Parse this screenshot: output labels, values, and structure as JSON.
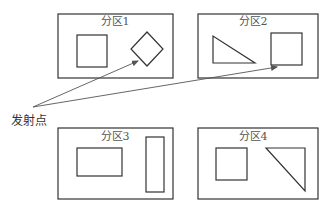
{
  "diagram": {
    "launch_point": {
      "label": "发射点",
      "x": 33,
      "y": 107
    },
    "colors": {
      "stroke": "#333333",
      "arrow": "#555555",
      "text": "#555555",
      "background": "#ffffff"
    },
    "partitions": [
      {
        "id": "p1",
        "label": "分区1",
        "box": {
          "x": 58,
          "y": 14,
          "w": 115,
          "h": 64
        },
        "shapes": [
          {
            "type": "square",
            "x": 77,
            "y": 35,
            "w": 30,
            "h": 32
          },
          {
            "type": "diamond",
            "points": "147,32 163,49 147,66 131,49"
          }
        ]
      },
      {
        "id": "p2",
        "label": "分区2",
        "box": {
          "x": 198,
          "y": 14,
          "w": 120,
          "h": 64
        },
        "shapes": [
          {
            "type": "triangle",
            "points": "213,36 213,63 255,63"
          },
          {
            "type": "square",
            "x": 271,
            "y": 33,
            "w": 31,
            "h": 32
          }
        ]
      },
      {
        "id": "p3",
        "label": "分区3",
        "box": {
          "x": 58,
          "y": 128,
          "w": 115,
          "h": 71
        },
        "shapes": [
          {
            "type": "rectangle",
            "x": 77,
            "y": 148,
            "w": 45,
            "h": 28
          },
          {
            "type": "rectangle",
            "x": 146,
            "y": 137,
            "w": 18,
            "h": 55
          }
        ]
      },
      {
        "id": "p4",
        "label": "分区4",
        "box": {
          "x": 198,
          "y": 128,
          "w": 120,
          "h": 71
        },
        "shapes": [
          {
            "type": "square",
            "x": 216,
            "y": 148,
            "w": 31,
            "h": 32
          },
          {
            "type": "triangle",
            "points": "266,148 305,148 305,191"
          }
        ]
      }
    ],
    "arrows": [
      {
        "from": "launch_point",
        "to": "p1-diamond",
        "x1": 33,
        "y1": 107,
        "x2": 138,
        "y2": 61
      },
      {
        "from": "launch_point",
        "to": "p2-square",
        "x1": 33,
        "y1": 107,
        "x2": 277,
        "y2": 67
      }
    ]
  }
}
